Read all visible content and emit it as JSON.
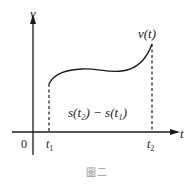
{
  "figure": {
    "caption": "圖二",
    "axes": {
      "x_label": "t",
      "y_label": "v",
      "origin_label": "0"
    },
    "ticks": {
      "t1_label": "t",
      "t1_sub": "1",
      "t2_label": "t",
      "t2_sub": "2"
    },
    "curve_label": "v(t)",
    "area_label": "s(t₂) − s(t₁)",
    "colors": {
      "line": "#1a1a1a",
      "background": "#ffffff"
    }
  }
}
